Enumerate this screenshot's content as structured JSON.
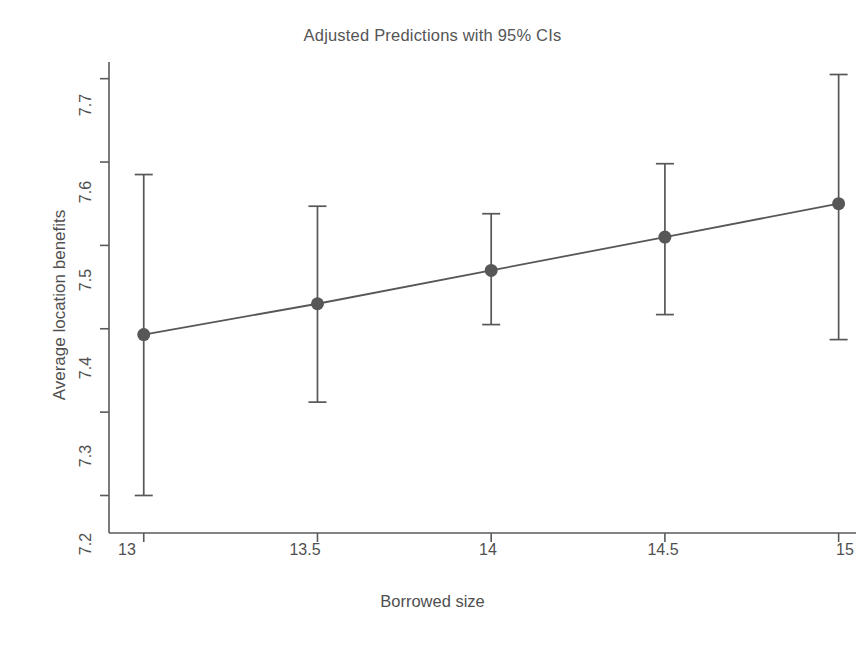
{
  "chart_data": {
    "type": "line",
    "title": "Adjusted Predictions with 95% CIs",
    "xlabel": "Borrowed size",
    "ylabel": "Average location benefits",
    "grid": false,
    "legend": null,
    "xlim": [
      12.9,
      15.05
    ],
    "ylim": [
      7.155,
      7.72
    ],
    "xticks": [
      13,
      13.5,
      14,
      14.5,
      15
    ],
    "xtick_labels": [
      "13",
      "13.5",
      "14",
      "14.5",
      "15"
    ],
    "yticks": [
      7.2,
      7.3,
      7.4,
      7.5,
      7.6,
      7.7
    ],
    "ytick_labels": [
      "7.2",
      "7.3",
      "7.4",
      "7.5",
      "7.6",
      "7.7"
    ],
    "x": [
      13,
      13.5,
      14,
      14.5,
      15
    ],
    "values": [
      7.393,
      7.43,
      7.47,
      7.51,
      7.55
    ],
    "ci_lower": [
      7.2,
      7.312,
      7.405,
      7.417,
      7.387
    ],
    "ci_upper": [
      7.585,
      7.547,
      7.538,
      7.598,
      7.705
    ],
    "series_name": "Adjusted prediction",
    "marker": "filled-circle",
    "marker_color": "#575757",
    "line_color": "#575757",
    "errorbar_color": "#575757",
    "background_color": "#ffffff"
  },
  "axes": {
    "y_tick_0": "7.2",
    "y_tick_1": "7.3",
    "y_tick_2": "7.4",
    "y_tick_3": "7.5",
    "y_tick_4": "7.6",
    "y_tick_5": "7.7",
    "x_tick_0": "13",
    "x_tick_1": "13.5",
    "x_tick_2": "14",
    "x_tick_3": "14.5",
    "x_tick_4": "15"
  }
}
